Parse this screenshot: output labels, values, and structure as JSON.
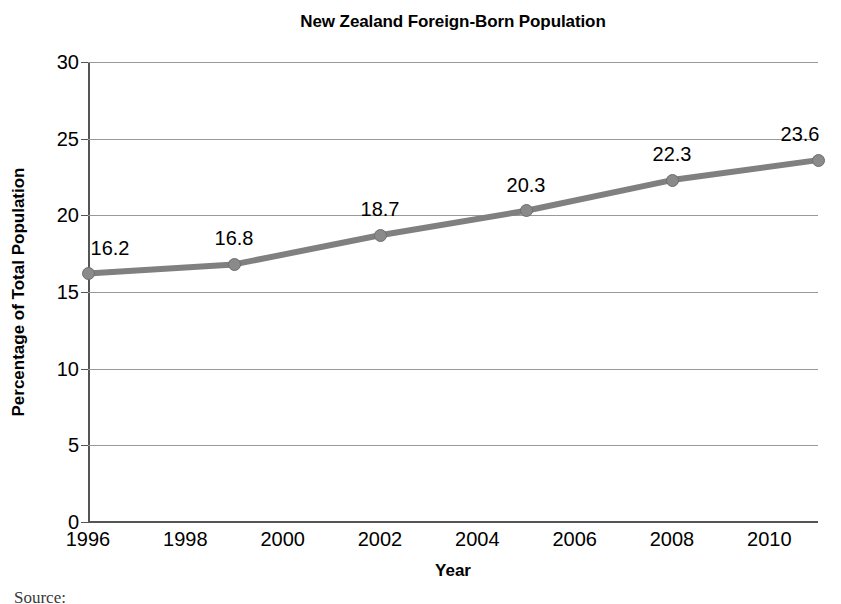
{
  "chart_data": {
    "type": "line",
    "title": "New Zealand Foreign-Born Population",
    "xlabel": "Year",
    "ylabel": "Percentage of Total Population",
    "x": [
      1996,
      1999,
      2002,
      2005,
      2008,
      2011
    ],
    "values": [
      16.2,
      16.8,
      18.7,
      20.3,
      22.3,
      23.6
    ],
    "point_labels": [
      "16.2",
      "16.8",
      "18.7",
      "20.3",
      "22.3",
      "23.6"
    ],
    "series": [
      {
        "name": "Percentage of Total Population",
        "values": [
          16.2,
          16.8,
          18.7,
          20.3,
          22.3,
          23.6
        ]
      }
    ],
    "xlim": [
      1996,
      2011
    ],
    "ylim": [
      0,
      30
    ],
    "y_ticks": [
      0,
      5,
      10,
      15,
      20,
      25,
      30
    ],
    "y_tick_labels": [
      "0",
      "5",
      "10",
      "15",
      "20",
      "25",
      "30"
    ],
    "x_ticks": [
      1996,
      1998,
      2000,
      2002,
      2004,
      2006,
      2008,
      2010
    ],
    "x_tick_labels": [
      "1996",
      "1998",
      "2000",
      "2002",
      "2004",
      "2006",
      "2008",
      "2010"
    ],
    "grid": "horizontal",
    "legend": "none",
    "line_color": "#808080",
    "marker_color": "#8a8a8a",
    "gridline_color": "#999999",
    "axis_color": "#555555"
  },
  "footer": {
    "source_label": "Source:"
  }
}
